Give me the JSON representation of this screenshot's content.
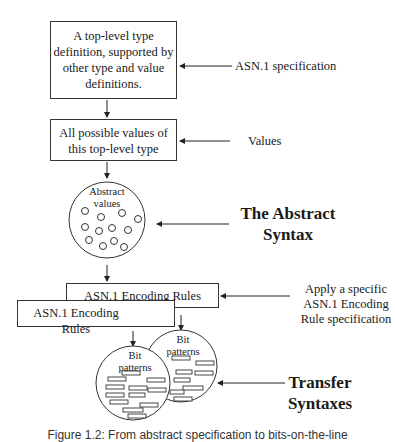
{
  "boxes": {
    "type_definition": "A top-level type definition, supported by other type and value definitions.",
    "all_values": "All possible values of this top-level type",
    "encoding_rules_back": "ASN.1 Encoding Rules",
    "encoding_rules_front": "ASN.1 Encoding Rules"
  },
  "labels": {
    "asn1_spec": "ASN.1 specification",
    "values": "Values",
    "abstract_syntax_line1": "The Abstract",
    "abstract_syntax_line2": "Syntax",
    "apply_rule_line1": "Apply a specific",
    "apply_rule_line2": "ASN.1 Encoding",
    "apply_rule_line3": "Rule specification",
    "transfer_line1": "Transfer",
    "transfer_line2": "Syntaxes"
  },
  "circles": {
    "abstract_values_line1": "Abstract",
    "abstract_values_line2": "values",
    "bit_patterns_back_line1": "Bit",
    "bit_patterns_back_line2": "patterns",
    "bit_patterns_front_line1": "Bit",
    "bit_patterns_front_line2": "patterns"
  },
  "caption": "Figure 1.2: From abstract specification to bits-on-the-line"
}
